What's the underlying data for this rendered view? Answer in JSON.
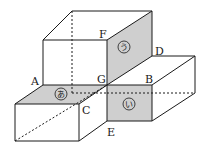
{
  "diagram": {
    "type": "isometric-block-figure",
    "colors": {
      "line": "#1a1a1a",
      "shade": "#cfcfcf",
      "background": "#ffffff"
    },
    "vertex_labels": {
      "A": "A",
      "B": "B",
      "C": "C",
      "D": "D",
      "E": "E",
      "F": "F",
      "G": "G"
    },
    "face_labels": {
      "a": "あ",
      "i": "い",
      "u": "う"
    }
  }
}
